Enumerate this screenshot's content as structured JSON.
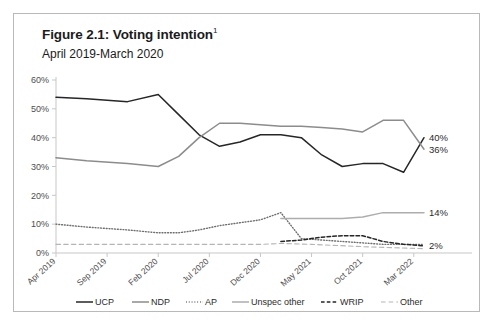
{
  "figure": {
    "title": "Figure 2.1: Voting intention",
    "title_footnote": "1",
    "subtitle": "April 2019-March 2020"
  },
  "chart_data": {
    "type": "line",
    "title": "Figure 2.1: Voting intention",
    "subtitle": "April 2019-March 2020",
    "xlabel": "",
    "ylabel": "",
    "ylim": [
      0,
      60
    ],
    "ytick_labels": [
      "0%",
      "10%",
      "20%",
      "30%",
      "40%",
      "50%",
      "60%"
    ],
    "ytick_values": [
      0,
      10,
      20,
      30,
      40,
      50,
      60
    ],
    "grid": false,
    "legend_position": "bottom",
    "xtick_labels": [
      "Apr 2019",
      "Sep 2019",
      "Feb 2020",
      "Jul 2020",
      "Dec 2020",
      "May 2021",
      "Oct 2021",
      "Mar 2022"
    ],
    "xtick_values": [
      0,
      5,
      10,
      15,
      20,
      25,
      30,
      35
    ],
    "xlim": [
      0,
      36
    ],
    "series": [
      {
        "name": "UCP",
        "color": "#262626",
        "style": "solid",
        "end_label": "40%",
        "x": [
          0,
          3,
          7,
          10,
          12,
          14,
          16,
          18,
          20,
          22,
          24,
          26,
          28,
          30,
          32,
          34,
          36
        ],
        "values": [
          54,
          53.5,
          52.5,
          55,
          48,
          41,
          37,
          38.5,
          41,
          41,
          40,
          34,
          30,
          31,
          31,
          28,
          40
        ]
      },
      {
        "name": "NDP",
        "color": "#8c8c8c",
        "style": "solid",
        "end_label": "36%",
        "x": [
          0,
          3,
          7,
          10,
          12,
          14,
          16,
          18,
          20,
          22,
          24,
          26,
          28,
          30,
          32,
          34,
          36
        ],
        "values": [
          33,
          32,
          31,
          30,
          33.5,
          40,
          45,
          45,
          44.5,
          44,
          44,
          43.5,
          43,
          42,
          46,
          46,
          36
        ]
      },
      {
        "name": "AP",
        "color": "#6e6e6e",
        "style": "dotted",
        "end_label": "",
        "x": [
          0,
          3,
          7,
          10,
          12,
          14,
          16,
          18,
          20,
          22,
          24,
          26,
          28,
          30,
          32,
          34,
          36
        ],
        "values": [
          10,
          9,
          8,
          7,
          7,
          8,
          9.5,
          10.5,
          11.5,
          14,
          5,
          4.5,
          4,
          3.5,
          3,
          3,
          3
        ]
      },
      {
        "name": "Unspec other",
        "color": "#adadad",
        "style": "solid",
        "end_label": "14%",
        "x": [
          22,
          24,
          26,
          28,
          30,
          32,
          34,
          36
        ],
        "values": [
          12,
          12,
          12,
          12,
          12.5,
          14,
          14,
          14
        ]
      },
      {
        "name": "WRIP",
        "color": "#262626",
        "style": "dashed",
        "end_label": "2%",
        "x": [
          22,
          24,
          26,
          28,
          30,
          32,
          34,
          36
        ],
        "values": [
          4,
          4.5,
          5.5,
          6,
          6,
          4,
          3,
          2.5
        ]
      },
      {
        "name": "Other",
        "color": "#b5b5b5",
        "style": "longdash",
        "end_label": "",
        "x": [
          0,
          5,
          10,
          15,
          20,
          22,
          25,
          30,
          36
        ],
        "values": [
          3,
          3,
          3,
          3,
          3,
          3.3,
          3,
          2.2,
          1.5
        ]
      }
    ],
    "end_labels": [
      {
        "text": "40%",
        "series": "UCP"
      },
      {
        "text": "36%",
        "series": "NDP"
      },
      {
        "text": "14%",
        "series": "Unspec other"
      },
      {
        "text": "2%",
        "series": "WRIP"
      }
    ],
    "legend": [
      {
        "label": "UCP",
        "color": "#262626",
        "style": "solid"
      },
      {
        "label": "NDP",
        "color": "#8c8c8c",
        "style": "solid"
      },
      {
        "label": "AP",
        "color": "#6e6e6e",
        "style": "dotted"
      },
      {
        "label": "Unspec other",
        "color": "#adadad",
        "style": "solid"
      },
      {
        "label": "WRIP",
        "color": "#262626",
        "style": "dashed"
      },
      {
        "label": "Other",
        "color": "#b5b5b5",
        "style": "longdash"
      }
    ]
  }
}
